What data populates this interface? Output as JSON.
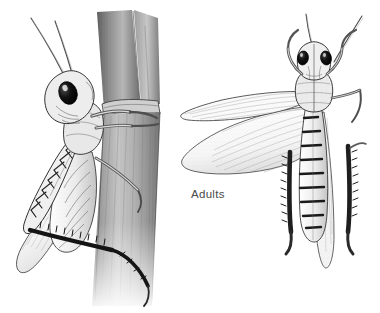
{
  "plate": {
    "title": "Adults",
    "medium": "pen-and-ink stipple illustration",
    "background_color": "#ffffff",
    "ink_color": "#2b2b2b",
    "mid_tone_color": "#8e8e8e",
    "light_tone_color": "#c9c9c9",
    "dark_accent_color": "#1a1a1a"
  },
  "caption": {
    "label": "Adults",
    "color": "#4a4a4a",
    "x": 191,
    "y": 188
  },
  "figures": [
    {
      "id": "lateral-grasshopper",
      "name": "Grasshopper adult, lateral view clinging to plant stem",
      "view": "lateral",
      "position": "left",
      "bounds": {
        "x": 10,
        "y": 14,
        "width": 170,
        "height": 292
      },
      "parts": [
        {
          "name": "antennae",
          "count": 2,
          "description": "long slender filiform antennae sweeping up and to the left"
        },
        {
          "name": "compound-eye",
          "count": 1,
          "description": "large oval solid black eye on side of head"
        },
        {
          "name": "head",
          "description": "rounded head with stippled shading"
        },
        {
          "name": "pronotum",
          "description": "saddle-shaped thoracic shield behind head"
        },
        {
          "name": "forewing",
          "description": "long narrow tegmen folded along body with fine parallel venation"
        },
        {
          "name": "hind-femur",
          "description": "enlarged jumping femur with dark chevron herringbone markings"
        },
        {
          "name": "hind-tibia",
          "description": "near-black slender tibia with row of spines, angled down-right"
        },
        {
          "name": "foreleg",
          "count": 2,
          "description": "pale forelegs gripping the stem"
        },
        {
          "name": "midleg",
          "description": "middle leg extending toward the stem"
        },
        {
          "name": "abdomen",
          "description": "segmented abdomen with banded shading"
        }
      ]
    },
    {
      "id": "plant-stem",
      "name": "Grass stem with leaf sheath",
      "position": "center-left",
      "bounds": {
        "x": 88,
        "y": 10,
        "width": 82,
        "height": 296
      },
      "parts": [
        {
          "name": "leaf-sheath",
          "description": "sheath splitting into a V at the top with dark shading"
        },
        {
          "name": "node",
          "description": "stem node band where grasshopper forelegs grip"
        },
        {
          "name": "stem-shaft",
          "description": "vertical striated stem fading to white at the bottom"
        }
      ]
    },
    {
      "id": "dorsal-grasshopper",
      "name": "Grasshopper adult, dorsal view with wings spread",
      "view": "dorsal",
      "position": "right",
      "bounds": {
        "x": 178,
        "y": 8,
        "width": 198,
        "height": 262
      },
      "parts": [
        {
          "name": "antennae",
          "count": 2,
          "description": "long antennae spreading up in a V"
        },
        {
          "name": "compound-eye",
          "count": 2,
          "description": "paired dark oval eyes on top of head"
        },
        {
          "name": "head",
          "description": "dorsal head capsule with median stripe"
        },
        {
          "name": "pronotum",
          "description": "dorsal thoracic shield with median carina"
        },
        {
          "name": "forewing",
          "description": "narrow stippled forewing extended to the left"
        },
        {
          "name": "hindwing",
          "description": "broad fan-shaped hindwing with radiating veins and stipple"
        },
        {
          "name": "folded-wing",
          "description": "pale wing folded over abdomen pointing down"
        },
        {
          "name": "abdomen",
          "description": "segmented abdomen with dark transverse bands"
        },
        {
          "name": "hind-tibia",
          "count": 2,
          "description": "two dark spined hind tibiae flanking the abdomen"
        },
        {
          "name": "foreleg",
          "count": 2,
          "description": "forelegs angled outward from thorax"
        },
        {
          "name": "midleg",
          "description": "middle leg extending right"
        }
      ]
    }
  ]
}
